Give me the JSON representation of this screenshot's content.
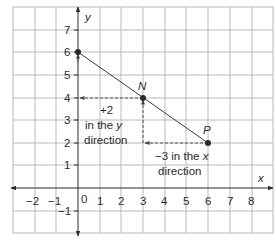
{
  "diagram": {
    "type": "coordinate-grid",
    "x_axis": {
      "label": "x",
      "min": -3,
      "max": 9,
      "tick_labels": [
        "-2",
        "-1",
        "0",
        "1",
        "2",
        "3",
        "4",
        "5",
        "6",
        "7",
        "8"
      ]
    },
    "y_axis": {
      "label": "y",
      "min": -2,
      "max": 8,
      "tick_labels": [
        "-1",
        "1",
        "2",
        "3",
        "4",
        "5",
        "6",
        "7"
      ]
    },
    "origin_label": "0",
    "points": [
      {
        "name": "",
        "x": 0,
        "y": 6
      },
      {
        "name": "N",
        "x": 3,
        "y": 4
      },
      {
        "name": "P",
        "x": 6,
        "y": 2
      }
    ],
    "line_segment": {
      "from": [
        0,
        6
      ],
      "to": [
        6,
        2
      ]
    },
    "annotations": {
      "y_direction": {
        "line1": "+2",
        "line2_prefix": "in the ",
        "line2_var": "y",
        "line3": "direction"
      },
      "x_direction": {
        "line1_prefix": "−3 in the ",
        "line1_var": "x",
        "line2": "direction"
      }
    },
    "colors": {
      "grid": "#b9b9b9",
      "axis": "#2b2b2b",
      "text": "#2b2b2b"
    }
  },
  "labels": {
    "x_axis": "x",
    "y_axis": "y",
    "point_N": "N",
    "point_P": "P",
    "origin": "0",
    "xt": {
      "m2": "−2",
      "m1": "−1",
      "p1": "1",
      "p2": "2",
      "p3": "3",
      "p4": "4",
      "p5": "5",
      "p6": "6",
      "p7": "7",
      "p8": "8"
    },
    "yt": {
      "m1": "−1",
      "p1": "1",
      "p2": "2",
      "p3": "3",
      "p4": "4",
      "p5": "5",
      "p6": "6",
      "p7": "7"
    },
    "ann_y_1": "+2",
    "ann_y_2a": "in the ",
    "ann_y_2b": "y",
    "ann_y_3": "direction",
    "ann_x_1a": "−3 in the ",
    "ann_x_1b": "x",
    "ann_x_2": "direction"
  }
}
